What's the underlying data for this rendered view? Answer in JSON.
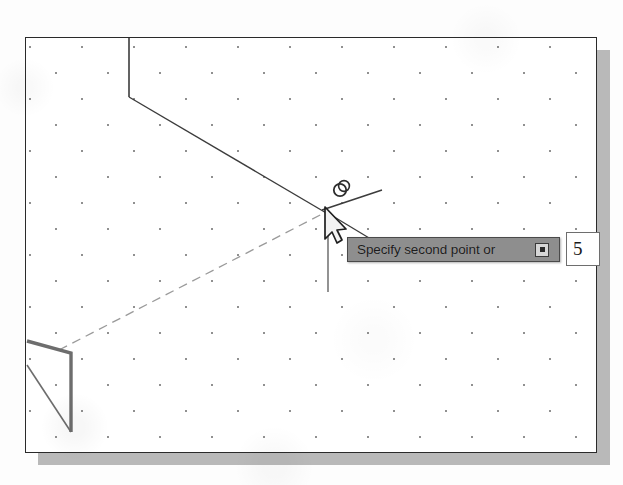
{
  "application": {
    "name": "autocad-drawing-window",
    "type": "cad-drawing-canvas"
  },
  "canvas": {
    "background_color": "#ffffff",
    "border_color": "#2a2a2a",
    "shadow_color": "#b9b9b9",
    "grid": {
      "name": "snap-grid",
      "dot_color": "#7d7d7d",
      "spacing_x": 52,
      "spacing_y": 26,
      "style": "staggered-dots"
    }
  },
  "tooltip": {
    "name": "dynamic-input-tooltip",
    "prompt": "Specify second point or",
    "background_color": "#8e8e8e",
    "border_color": "#4a4a4a",
    "expand_icon": "expand-options-icon"
  },
  "input": {
    "name": "distance-input",
    "value": "5",
    "placeholder": "5",
    "background_color": "#ffffff",
    "border_color": "#6e6e6e"
  },
  "cursor": {
    "name": "arrow-pointer",
    "x": 327,
    "y": 212,
    "snap_marker": "nearest-snap-circles"
  },
  "geometry": {
    "line_color": "#3c3c3c",
    "tracking_line_color": "#9a9a9a",
    "entities": [
      {
        "name": "vertical-wall-edge-top",
        "type": "line"
      },
      {
        "name": "diagonal-roof-line",
        "type": "line"
      },
      {
        "name": "rubber-band-line",
        "type": "line"
      },
      {
        "name": "vertical-rubber-band",
        "type": "line"
      },
      {
        "name": "polar-tracking-line",
        "type": "dashed-line"
      },
      {
        "name": "lower-left-panel",
        "type": "polyline"
      }
    ]
  }
}
